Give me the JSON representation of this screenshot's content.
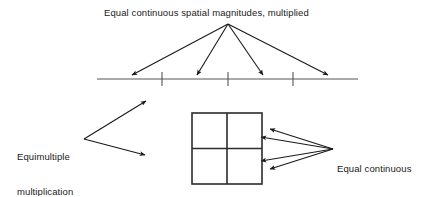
{
  "diagram": {
    "title_label": "Equal continuous spatial magnitudes, multiplied",
    "left_label_line1": "Equimultiple",
    "left_label_line2": "multiplication",
    "right_label_line1": "Equal continuous",
    "right_label_line2": "spatial magnitudes,",
    "right_label_line3": "multiplied",
    "colors": {
      "background": "#ffffff",
      "text": "#1a1a1a",
      "arrow": "#1a1a1a",
      "number_line": "#555555",
      "square": "#2b2b2b"
    }
  },
  "number_line": {
    "start_x": 97,
    "end_x": 358,
    "y": 79,
    "tick_count": 3,
    "tick_positions": [
      162,
      228,
      293
    ],
    "tick_half_height": 7
  },
  "top_arrows": {
    "origin_x": 228,
    "origin_y": 24,
    "count": 4,
    "target_points": [
      {
        "x": 132,
        "y": 75
      },
      {
        "x": 197,
        "y": 75
      },
      {
        "x": 263,
        "y": 75
      },
      {
        "x": 328,
        "y": 75
      }
    ]
  },
  "left_arrows": {
    "origin_x": 84,
    "origin_y": 139,
    "count": 2,
    "target_points": [
      {
        "x": 146,
        "y": 101
      },
      {
        "x": 145,
        "y": 155
      }
    ]
  },
  "right_arrows": {
    "origin_x": 333,
    "origin_y": 149,
    "count": 4,
    "target_points": [
      {
        "x": 270,
        "y": 129
      },
      {
        "x": 261,
        "y": 137
      },
      {
        "x": 261,
        "y": 161
      },
      {
        "x": 270,
        "y": 169
      }
    ]
  },
  "square_grid": {
    "left": 192,
    "top": 113,
    "width": 70,
    "height": 71,
    "rows": 2,
    "columns": 2
  }
}
